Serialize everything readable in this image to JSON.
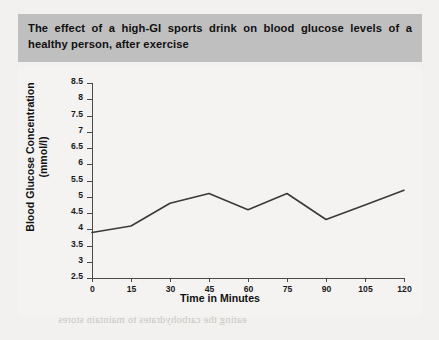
{
  "figure": {
    "title": "The effect of a high-GI sports drink on blood glucose levels of a healthy person, after exercise",
    "title_band_color": "#bfbfbf",
    "page_background": "#f2f1ef",
    "plot_background": "#f4f3f1",
    "line_color": "#3a3a3a",
    "axis_color": "#4a4a4a"
  },
  "chart_data": {
    "type": "line",
    "title": "The effect of a high-GI sports drink on blood glucose levels of a healthy person, after exercise",
    "xlabel": "Time in Minutes",
    "ylabel": "Blood Glucose Concentration (mmol/l)",
    "ylabel_line1": "Blood Glucose Concentration",
    "ylabel_line2": "(mmol/l)",
    "x": [
      0,
      15,
      30,
      45,
      60,
      75,
      90,
      105,
      120
    ],
    "xticks": [
      "0",
      "15",
      "30",
      "45",
      "60",
      "75",
      "90",
      "105",
      "120"
    ],
    "values": [
      3.9,
      4.1,
      4.8,
      5.1,
      4.6,
      5.1,
      4.3,
      4.75,
      5.2
    ],
    "yticks": [
      "8.5",
      "8",
      "7.5",
      "7",
      "6.5",
      "6",
      "5.5",
      "5",
      "4.5",
      "4",
      "3.5",
      "3",
      "2.5"
    ],
    "ytick_values": [
      8.5,
      8,
      7.5,
      7,
      6.5,
      6,
      5.5,
      5,
      4.5,
      4,
      3.5,
      3,
      2.5
    ],
    "ylim": [
      2.5,
      8.5
    ],
    "xlim": [
      0,
      120
    ],
    "grid": false,
    "legend": null,
    "markers": false
  },
  "bleed_through": [
    {
      "text": "one third of your energy intake",
      "left": 62,
      "top": 86
    },
    {
      "text": "from starchy carbohydrate",
      "left": 120,
      "top": 100
    },
    {
      "text": "by eating low-GI foods at the main meal and",
      "left": 78,
      "top": 136
    },
    {
      "text": "carbohydrate at every meal, the fibre and whole",
      "left": 88,
      "top": 150
    },
    {
      "text": "grains",
      "left": 188,
      "top": 164
    },
    {
      "text": "you rely on refined foods, supplement your diet",
      "left": 66,
      "top": 212
    },
    {
      "text": "and a sports meal, to replace the energy used",
      "left": 60,
      "top": 250
    },
    {
      "text": "ers during their training sessions",
      "left": 54,
      "top": 264
    },
    {
      "text": "and to sports meal, to help the body recover",
      "left": 52,
      "top": 300
    },
    {
      "text": "eating the carbohydrates to maintain stores",
      "left": 58,
      "top": 314
    }
  ]
}
